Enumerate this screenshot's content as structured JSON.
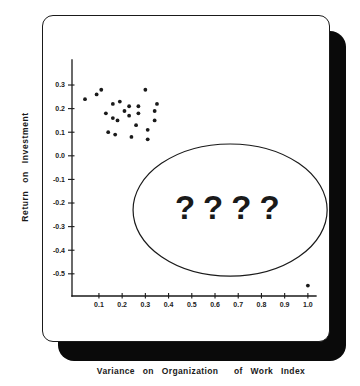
{
  "page": {
    "background": "#ffffff"
  },
  "colors": {
    "ink": "#1a1a1a",
    "paper": "#ffffff",
    "shadow": "#0a0a0a"
  },
  "chart_data": {
    "type": "scatter",
    "title": "",
    "xlabel": "Variance on Organization  of Work Index",
    "ylabel": "Return on Investment",
    "xlim": [
      -0.016,
      1.035
    ],
    "ylim": [
      -0.594,
      0.406
    ],
    "grid": false,
    "legend": "none",
    "x_ticks": [
      {
        "v": 0.1,
        "label": "0.1"
      },
      {
        "v": 0.2,
        "label": "0.2"
      },
      {
        "v": 0.3,
        "label": "0.3"
      },
      {
        "v": 0.4,
        "label": "0.4"
      },
      {
        "v": 0.5,
        "label": "0.5"
      },
      {
        "v": 0.6,
        "label": "0.6"
      },
      {
        "v": 0.7,
        "label": "0.7"
      },
      {
        "v": 0.8,
        "label": "0.8"
      },
      {
        "v": 0.9,
        "label": "0.9"
      },
      {
        "v": 1.0,
        "label": "1.0"
      }
    ],
    "y_ticks": [
      {
        "v": 0.3,
        "label": "0.3"
      },
      {
        "v": 0.2,
        "label": "0.2"
      },
      {
        "v": 0.1,
        "label": "0.1"
      },
      {
        "v": 0.0,
        "label": "0.0"
      },
      {
        "v": -0.1,
        "label": "-0.1"
      },
      {
        "v": -0.2,
        "label": "-0.2"
      },
      {
        "v": -0.3,
        "label": "-0.3"
      },
      {
        "v": -0.4,
        "label": "-0.4"
      },
      {
        "v": -0.5,
        "label": "-0.5"
      }
    ],
    "points": [
      [
        0.04,
        0.24
      ],
      [
        0.09,
        0.26
      ],
      [
        0.11,
        0.28
      ],
      [
        0.16,
        0.22
      ],
      [
        0.19,
        0.23
      ],
      [
        0.13,
        0.18
      ],
      [
        0.16,
        0.16
      ],
      [
        0.18,
        0.15
      ],
      [
        0.14,
        0.1
      ],
      [
        0.17,
        0.09
      ],
      [
        0.3,
        0.28
      ],
      [
        0.23,
        0.21
      ],
      [
        0.27,
        0.21
      ],
      [
        0.35,
        0.22
      ],
      [
        0.21,
        0.19
      ],
      [
        0.23,
        0.17
      ],
      [
        0.27,
        0.18
      ],
      [
        0.34,
        0.19
      ],
      [
        0.34,
        0.15
      ],
      [
        0.26,
        0.13
      ],
      [
        0.31,
        0.11
      ],
      [
        0.24,
        0.08
      ],
      [
        0.31,
        0.07
      ],
      [
        1.0,
        -0.55
      ]
    ],
    "annotation": {
      "text": "????",
      "text_cx": 0.67,
      "text_cy": -0.217,
      "ellipse": {
        "cx": 0.665,
        "cy": -0.23,
        "rx": 0.418,
        "ry": 0.28
      }
    }
  }
}
